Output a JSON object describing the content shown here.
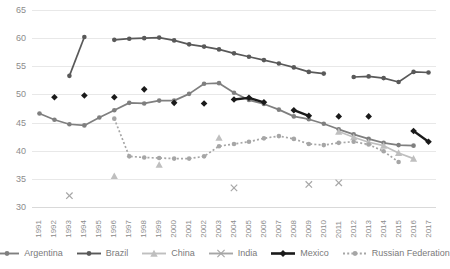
{
  "chart_data": {
    "type": "line",
    "title": "",
    "xlabel": "",
    "ylabel": "",
    "ylim": [
      30,
      65
    ],
    "yticks": [
      30,
      35,
      40,
      45,
      50,
      55,
      60,
      65
    ],
    "grid": true,
    "legend_position": "bottom",
    "categories": [
      "1991",
      "1992",
      "1993",
      "1994",
      "1995",
      "1996",
      "1997",
      "1998",
      "1999",
      "2000",
      "2001",
      "2002",
      "2003",
      "2004",
      "2005",
      "2006",
      "2007",
      "2008",
      "2009",
      "2010",
      "2011",
      "2012",
      "2013",
      "2014",
      "2015",
      "2016",
      "2017"
    ],
    "series": [
      {
        "name": "Argentina",
        "color": "#7f7f7f",
        "marker": "circle",
        "line_style": "solid",
        "values": [
          46.6,
          45.5,
          44.7,
          44.5,
          45.9,
          47.2,
          48.5,
          48.4,
          48.9,
          48.9,
          50.1,
          51.9,
          52.0,
          50.3,
          49.0,
          48.3,
          47.3,
          46.1,
          45.6,
          44.8,
          43.8,
          42.9,
          42.1,
          41.4,
          41.0,
          40.9,
          null
        ]
      },
      {
        "name": "Brazil",
        "color": "#595959",
        "marker": "circle",
        "line_style": "solid",
        "values": [
          null,
          null,
          53.3,
          60.2,
          null,
          59.7,
          59.9,
          60.0,
          60.1,
          59.6,
          58.9,
          58.5,
          58.0,
          57.3,
          56.7,
          56.1,
          55.5,
          54.8,
          54.0,
          53.7,
          null,
          53.1,
          53.2,
          52.9,
          52.2,
          54.0,
          53.9
        ]
      },
      {
        "name": "China",
        "color": "#bfbfbf",
        "marker": "triangle",
        "line_style": "solid",
        "values": [
          null,
          null,
          null,
          null,
          null,
          35.5,
          null,
          null,
          37.5,
          null,
          null,
          null,
          42.3,
          null,
          null,
          null,
          null,
          null,
          null,
          null,
          43.4,
          42.4,
          41.5,
          40.9,
          39.6,
          38.6,
          null
        ]
      },
      {
        "name": "India",
        "color": "#a6a6a6",
        "marker": "x",
        "line_style": "solid",
        "values": [
          null,
          null,
          32.0,
          null,
          null,
          null,
          null,
          null,
          null,
          null,
          null,
          null,
          null,
          33.4,
          null,
          null,
          null,
          null,
          34.0,
          null,
          34.3,
          null,
          null,
          null,
          null,
          null,
          null
        ]
      },
      {
        "name": "Mexico",
        "color": "#1a1a1a",
        "marker": "diamond",
        "line_style": "solid",
        "values": [
          null,
          49.5,
          null,
          49.8,
          null,
          49.5,
          null,
          50.9,
          null,
          48.5,
          null,
          48.4,
          null,
          49.1,
          49.4,
          48.6,
          null,
          47.2,
          46.2,
          null,
          46.1,
          null,
          46.1,
          null,
          null,
          43.5,
          41.6
        ]
      },
      {
        "name": "Russian Federation",
        "color": "#a6a6a6",
        "marker": "circle",
        "line_style": "dotted",
        "values": [
          null,
          null,
          null,
          null,
          null,
          45.7,
          39.0,
          38.8,
          38.7,
          38.6,
          38.6,
          39.0,
          40.8,
          41.2,
          41.6,
          42.2,
          42.6,
          42.1,
          41.2,
          41.0,
          41.4,
          41.6,
          41.1,
          39.9,
          38.0,
          null,
          null
        ]
      }
    ]
  }
}
